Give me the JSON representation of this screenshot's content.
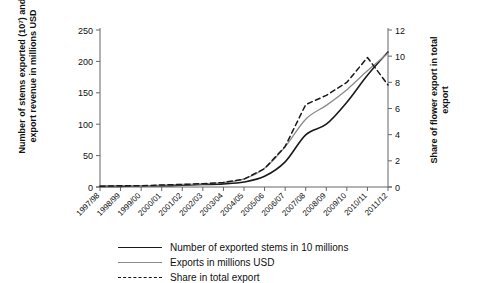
{
  "chart_data": {
    "type": "line",
    "title": "",
    "subtitle": "",
    "xlabel": "",
    "ylabel": "Number of stems exported (10⁷) and export revenue in millions USD",
    "ylabel_right": "Share of flower export in total export",
    "grid": false,
    "legend_position": "bottom",
    "ylim": [
      0,
      250
    ],
    "ylim_right": [
      0,
      12
    ],
    "yticks": [
      0,
      50,
      100,
      150,
      200,
      250
    ],
    "yticks_right": [
      0,
      2,
      4,
      6,
      8,
      10,
      12
    ],
    "categories": [
      "1997/98",
      "1998/99",
      "1999/00",
      "2000/01",
      "2001/02",
      "2002/03",
      "2003/04",
      "2004/05",
      "2005/06",
      "2006/07",
      "2007/08",
      "2008/09",
      "2009/10",
      "2010/11",
      "2011/12"
    ],
    "series": [
      {
        "name": "Number of exported stems in 10 millions",
        "axis": "left",
        "style": "solid",
        "color": "#1a1a1a",
        "values": [
          1,
          1,
          2,
          2,
          3,
          4,
          5,
          8,
          17,
          40,
          83,
          100,
          135,
          178,
          215
        ]
      },
      {
        "name": "Exports in millions USD",
        "axis": "left",
        "style": "solid",
        "color": "#8b8b8b",
        "values": [
          1,
          2,
          2,
          3,
          4,
          5,
          7,
          13,
          30,
          64,
          108,
          130,
          155,
          185,
          213
        ]
      },
      {
        "name": "Share in total export",
        "axis": "right",
        "style": "dashed",
        "color": "#1a1a1a",
        "values": [
          0.05,
          0.1,
          0.1,
          0.15,
          0.2,
          0.25,
          0.35,
          0.6,
          1.4,
          3.1,
          6.3,
          7.0,
          8.0,
          9.9,
          7.8
        ]
      }
    ]
  },
  "legend": {
    "items": [
      {
        "label": "Number of exported stems in 10 millions",
        "style": "solid-black"
      },
      {
        "label": "Exports in millions USD",
        "style": "solid-gray"
      },
      {
        "label": "Share in total export",
        "style": "dashed-black"
      }
    ]
  },
  "axes": {
    "left_title": "Number of stems exported (10⁷) and export revenue in millions USD",
    "right_title": "Share of flower export in total export"
  }
}
